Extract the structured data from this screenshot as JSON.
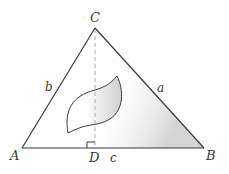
{
  "diagram": {
    "type": "triangle-with-altitude",
    "vertices": {
      "A": {
        "label": "A",
        "x": 22,
        "y": 148
      },
      "B": {
        "label": "B",
        "x": 204,
        "y": 148
      },
      "C": {
        "label": "C",
        "x": 95,
        "y": 28
      }
    },
    "foot": {
      "label": "D",
      "x": 95,
      "y": 148
    },
    "sides": {
      "a": {
        "label": "a",
        "between": [
          "B",
          "C"
        ]
      },
      "b": {
        "label": "b",
        "between": [
          "A",
          "C"
        ]
      },
      "c": {
        "label": "c",
        "between": [
          "A",
          "B"
        ]
      }
    },
    "altitude": {
      "from": "C",
      "to": "D",
      "style": "dashed"
    },
    "right_angle_marker": {
      "at": "D"
    },
    "region": {
      "shape": "leaf",
      "shaded": true
    },
    "colors": {
      "stroke": "#3a3a3a",
      "dashed": "#b0b0b0",
      "shade": "#d8d8d8",
      "background": "#ffffff"
    }
  }
}
